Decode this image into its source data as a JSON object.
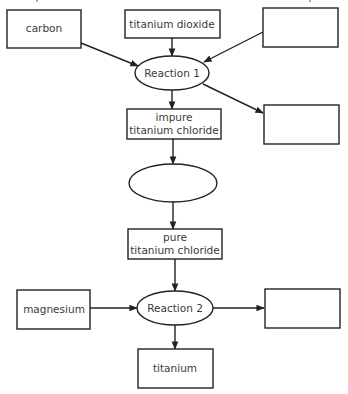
{
  "diagram": {
    "type": "flowchart",
    "topic": "titanium extraction",
    "nodes": {
      "carbon": {
        "label": "carbon",
        "shape": "rect"
      },
      "titanium_dioxide": {
        "label": "titanium dioxide",
        "shape": "rect"
      },
      "blank_top_right": {
        "label": "",
        "shape": "rect"
      },
      "reaction1": {
        "label": "Reaction 1",
        "shape": "ellipse"
      },
      "blank_mid_right": {
        "label": "",
        "shape": "rect"
      },
      "impure_tc": {
        "line1": "impure",
        "line2": "titanium chloride",
        "shape": "rect"
      },
      "blank_ellipse": {
        "label": "",
        "shape": "ellipse"
      },
      "pure_tc": {
        "line1": "pure",
        "line2": "titanium chloride",
        "shape": "rect"
      },
      "magnesium": {
        "label": "magnesium",
        "shape": "rect"
      },
      "reaction2": {
        "label": "Reaction 2",
        "shape": "ellipse"
      },
      "blank_bottom_right": {
        "label": "",
        "shape": "rect"
      },
      "titanium": {
        "label": "titanium",
        "shape": "rect"
      }
    },
    "edges": [
      {
        "from": "carbon",
        "to": "reaction1"
      },
      {
        "from": "titanium_dioxide",
        "to": "reaction1"
      },
      {
        "from": "blank_top_right",
        "to": "reaction1"
      },
      {
        "from": "reaction1",
        "to": "impure_tc"
      },
      {
        "from": "reaction1",
        "to": "blank_mid_right"
      },
      {
        "from": "impure_tc",
        "to": "blank_ellipse"
      },
      {
        "from": "blank_ellipse",
        "to": "pure_tc"
      },
      {
        "from": "pure_tc",
        "to": "reaction2"
      },
      {
        "from": "magnesium",
        "to": "reaction2"
      },
      {
        "from": "reaction2",
        "to": "blank_bottom_right"
      },
      {
        "from": "reaction2",
        "to": "titanium"
      }
    ]
  }
}
